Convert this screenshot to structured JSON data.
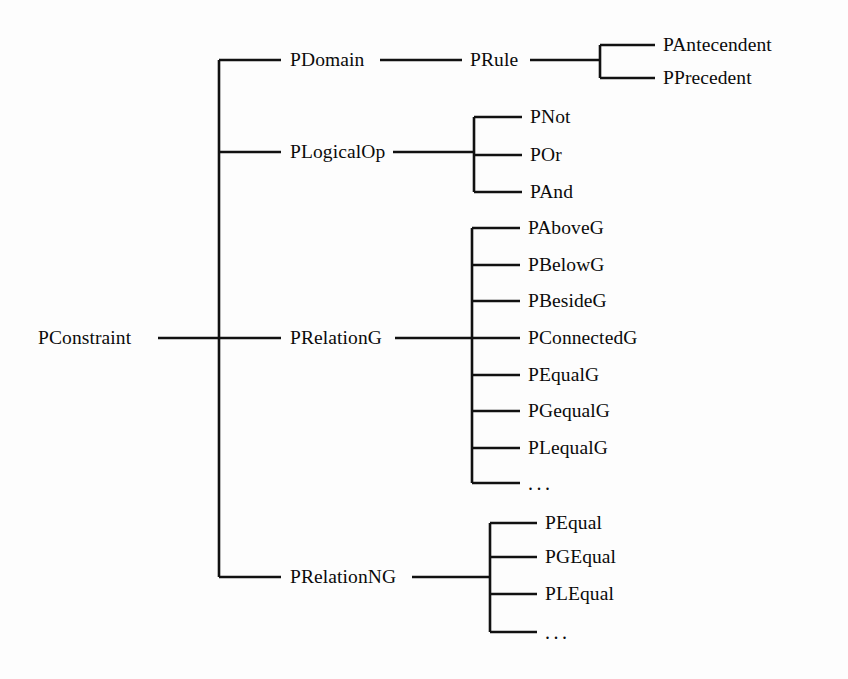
{
  "diagram": {
    "type": "tree",
    "orientation": "left-to-right",
    "background_color": "#fdfdfd",
    "line_color": "#111111",
    "text_color": "#0b0b0b",
    "ellipsis_text": "...",
    "root": {
      "label": "PConstraint",
      "x": 38,
      "y": 338
    },
    "level1": [
      {
        "label": "PDomain",
        "x": 290,
        "y": 60
      },
      {
        "label": "PLogicalOp",
        "x": 290,
        "y": 152
      },
      {
        "label": "PRelationG",
        "x": 290,
        "y": 338
      },
      {
        "label": "PRelationNG",
        "x": 290,
        "y": 577
      }
    ],
    "level2": {
      "prule": {
        "label": "PRule",
        "x": 470,
        "y": 60
      },
      "plogicalop_children": [
        {
          "label": "PNot",
          "x": 530,
          "y": 117
        },
        {
          "label": "POr",
          "x": 530,
          "y": 155
        },
        {
          "label": "PAnd",
          "x": 530,
          "y": 192
        }
      ],
      "prelationg_children": [
        {
          "label": "PAboveG",
          "x": 528,
          "y": 228
        },
        {
          "label": "PBelowG",
          "x": 528,
          "y": 265
        },
        {
          "label": "PBesideG",
          "x": 528,
          "y": 301
        },
        {
          "label": "PConnectedG",
          "x": 528,
          "y": 338
        },
        {
          "label": "PEqualG",
          "x": 528,
          "y": 375
        },
        {
          "label": "PGequalG",
          "x": 528,
          "y": 411
        },
        {
          "label": "PLequalG",
          "x": 528,
          "y": 448
        },
        {
          "label": "...",
          "x": 528,
          "y": 483,
          "is_ellipsis": true
        }
      ],
      "prelationng_children": [
        {
          "label": "PEqual",
          "x": 545,
          "y": 523
        },
        {
          "label": "PGEqual",
          "x": 545,
          "y": 557
        },
        {
          "label": "PLEqual",
          "x": 545,
          "y": 594
        },
        {
          "label": "...",
          "x": 545,
          "y": 632,
          "is_ellipsis": true
        }
      ]
    },
    "level3": {
      "prule_children": [
        {
          "label": "PAntecendent",
          "x": 663,
          "y": 45
        },
        {
          "label": "PPrecedent",
          "x": 663,
          "y": 78
        }
      ]
    },
    "geometry": {
      "root_stub_x1": 158,
      "root_stub_x2": 219,
      "trunk_x": 219,
      "trunk_y_top": 60,
      "trunk_y_bottom": 577,
      "level1_arm_x2": 281,
      "pdomain_link_x1": 380,
      "pdomain_link_x2": 462,
      "prule_link_x1": 530,
      "prule_link_x2": 600,
      "prule_bracket_x": 600,
      "prule_bracket_top": 45,
      "prule_bracket_bottom": 78,
      "prule_arm_x2": 655,
      "plogicalop_link_x1": 393,
      "plogicalop_link_x2": 474,
      "plogicalop_bracket_x": 474,
      "plogicalop_bracket_top": 117,
      "plogicalop_bracket_bottom": 192,
      "plogicalop_arm_x2": 522,
      "prelationg_link_x1": 395,
      "prelationg_link_x2": 472,
      "prelationg_bracket_x": 472,
      "prelationg_bracket_top": 228,
      "prelationg_bracket_bottom": 483,
      "prelationg_arm_x2": 520,
      "prelationng_link_x1": 412,
      "prelationng_link_x2": 490,
      "prelationng_bracket_x": 490,
      "prelationng_bracket_top": 523,
      "prelationng_bracket_bottom": 632,
      "prelationng_arm_x2": 537
    }
  }
}
